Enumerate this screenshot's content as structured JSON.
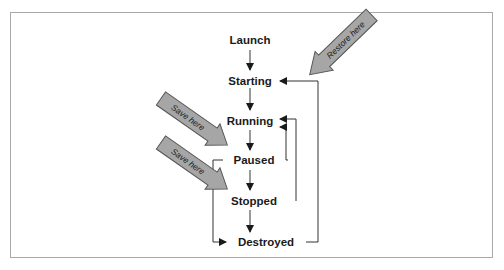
{
  "diagram": {
    "type": "state-lifecycle-flowchart",
    "states": [
      {
        "id": "launch",
        "label": "Launch"
      },
      {
        "id": "starting",
        "label": "Starting"
      },
      {
        "id": "running",
        "label": "Running"
      },
      {
        "id": "paused",
        "label": "Paused"
      },
      {
        "id": "stopped",
        "label": "Stopped"
      },
      {
        "id": "destroyed",
        "label": "Destroyed"
      }
    ],
    "edges": [
      {
        "from": "launch",
        "to": "starting"
      },
      {
        "from": "starting",
        "to": "running"
      },
      {
        "from": "running",
        "to": "paused"
      },
      {
        "from": "paused",
        "to": "stopped"
      },
      {
        "from": "stopped",
        "to": "destroyed"
      },
      {
        "from": "paused",
        "to": "running"
      },
      {
        "from": "stopped",
        "to": "running"
      },
      {
        "from": "destroyed",
        "to": "starting"
      },
      {
        "from": "paused",
        "to": "destroyed"
      }
    ],
    "callouts": [
      {
        "id": "restore",
        "label": "Restore here",
        "target": "starting"
      },
      {
        "id": "save1",
        "label": "Save here",
        "target": "paused"
      },
      {
        "id": "save2",
        "label": "Save here",
        "target": "stopped"
      }
    ],
    "colors": {
      "callout_fill": "#a6a6a6",
      "callout_stroke": "#555555",
      "line": "#333333",
      "frame": "#a8a8a8"
    }
  }
}
